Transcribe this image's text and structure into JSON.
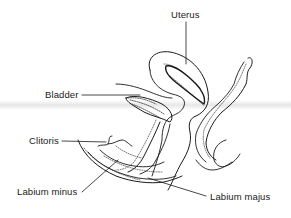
{
  "diagram": {
    "labels": [
      {
        "id": "uterus",
        "text": "Uterus"
      },
      {
        "id": "bladder",
        "text": "Bladder"
      },
      {
        "id": "clitoris",
        "text": "Clitoris"
      },
      {
        "id": "labium-minus",
        "text": "Labium minus"
      },
      {
        "id": "labium-majus",
        "text": "Labium majus"
      }
    ],
    "colors": {
      "ink": "#1a1a1a",
      "background": "#ffffff"
    }
  }
}
